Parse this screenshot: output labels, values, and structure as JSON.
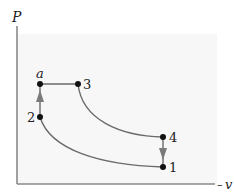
{
  "diagram": {
    "axes": {
      "y_label": "P",
      "x_label": "v",
      "x_label_prefix": "–"
    },
    "colors": {
      "axis": "#8a8a8a",
      "curve": "#6a6a6a",
      "arrow": "#7a7a7a",
      "point": "#111111",
      "background": "#ffffff",
      "plot_background": "#f6f6f6"
    },
    "points": [
      {
        "id": "1",
        "label": "1",
        "x": 163,
        "y": 167
      },
      {
        "id": "2",
        "label": "2",
        "x": 40,
        "y": 117
      },
      {
        "id": "a",
        "label": "a",
        "x": 40,
        "y": 84
      },
      {
        "id": "3",
        "label": "3",
        "x": 78,
        "y": 84
      },
      {
        "id": "4",
        "label": "4",
        "x": 163,
        "y": 137
      }
    ],
    "processes": [
      {
        "from": "1",
        "to": "2",
        "type": "curve",
        "label": "isentropic compression"
      },
      {
        "from": "2",
        "to": "a",
        "type": "line",
        "arrow": true,
        "label": "constant volume heat addition"
      },
      {
        "from": "a",
        "to": "3",
        "type": "line",
        "label": "constant pressure heat addition"
      },
      {
        "from": "3",
        "to": "4",
        "type": "curve",
        "label": "isentropic expansion"
      },
      {
        "from": "4",
        "to": "1",
        "type": "line",
        "arrow": true,
        "label": "constant volume heat rejection"
      }
    ]
  }
}
